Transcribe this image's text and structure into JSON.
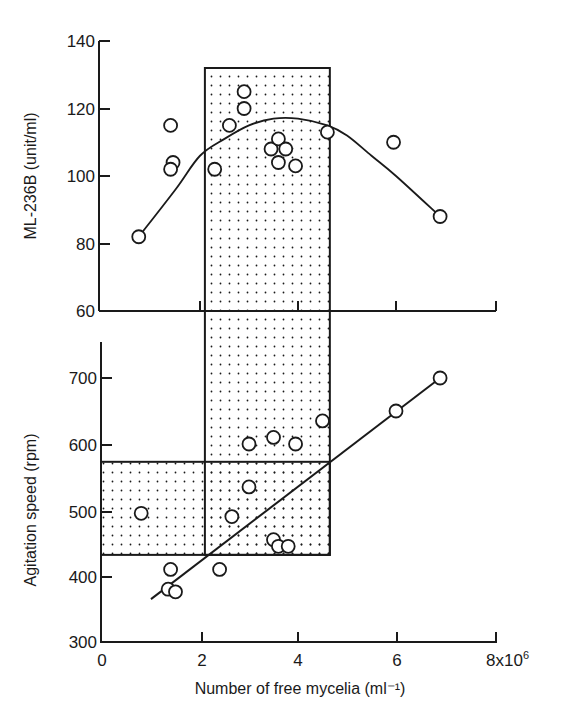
{
  "chart_data": [
    {
      "panel": "top",
      "type": "scatter",
      "title": "",
      "xlabel": "Number of free mycelia (ml⁻¹)",
      "ylabel": "ML-236B (unit/ml)",
      "xlim": [
        0,
        8
      ],
      "ylim": [
        60,
        140
      ],
      "x_ticks": [
        0,
        2,
        4,
        6,
        8
      ],
      "y_ticks": [
        60,
        80,
        100,
        120,
        140
      ],
      "y_tick_labels": [
        "60",
        "80",
        "100",
        "120",
        "140"
      ],
      "grid": false,
      "points": [
        {
          "x": 0.75,
          "y": 82
        },
        {
          "x": 1.4,
          "y": 115
        },
        {
          "x": 1.45,
          "y": 104
        },
        {
          "x": 1.4,
          "y": 102
        },
        {
          "x": 2.3,
          "y": 102
        },
        {
          "x": 2.6,
          "y": 115
        },
        {
          "x": 2.9,
          "y": 125
        },
        {
          "x": 2.9,
          "y": 120
        },
        {
          "x": 3.45,
          "y": 108
        },
        {
          "x": 3.6,
          "y": 111
        },
        {
          "x": 3.75,
          "y": 108
        },
        {
          "x": 3.6,
          "y": 104
        },
        {
          "x": 3.95,
          "y": 103
        },
        {
          "x": 4.6,
          "y": 113
        },
        {
          "x": 5.95,
          "y": 110
        },
        {
          "x": 6.9,
          "y": 88
        }
      ],
      "fit_curve": {
        "type": "quadratic",
        "points": [
          {
            "x": 0.75,
            "y": 82
          },
          {
            "x": 1.5,
            "y": 96
          },
          {
            "x": 2.0,
            "y": 106
          },
          {
            "x": 2.5,
            "y": 111
          },
          {
            "x": 3.0,
            "y": 115
          },
          {
            "x": 3.5,
            "y": 117
          },
          {
            "x": 4.0,
            "y": 117
          },
          {
            "x": 4.6,
            "y": 115
          },
          {
            "x": 5.0,
            "y": 112
          },
          {
            "x": 5.5,
            "y": 106
          },
          {
            "x": 6.0,
            "y": 100
          },
          {
            "x": 6.9,
            "y": 88
          }
        ]
      },
      "shaded_region": {
        "x_min": 2.1,
        "x_max": 4.65,
        "y_min": 60,
        "y_max": 132
      }
    },
    {
      "panel": "bottom",
      "type": "scatter",
      "title": "",
      "xlabel": "Number of free mycelia (ml⁻¹)",
      "ylabel": "Agitation speed (rpm)",
      "xlim": [
        0,
        8
      ],
      "ylim": [
        300,
        700
      ],
      "x_ticks": [
        0,
        2,
        4,
        6,
        8
      ],
      "x_tick_labels": [
        "0",
        "2",
        "4",
        "6",
        "8x10⁶"
      ],
      "y_ticks": [
        300,
        400,
        500,
        600,
        700
      ],
      "y_tick_labels": [
        "300",
        "400",
        "500",
        "600",
        "700"
      ],
      "grid": false,
      "points": [
        {
          "x": 0.8,
          "y": 495
        },
        {
          "x": 1.4,
          "y": 410
        },
        {
          "x": 1.35,
          "y": 380
        },
        {
          "x": 1.5,
          "y": 376
        },
        {
          "x": 2.4,
          "y": 410
        },
        {
          "x": 2.65,
          "y": 490
        },
        {
          "x": 3.0,
          "y": 535
        },
        {
          "x": 3.0,
          "y": 600
        },
        {
          "x": 3.5,
          "y": 610
        },
        {
          "x": 3.95,
          "y": 600
        },
        {
          "x": 4.5,
          "y": 635
        },
        {
          "x": 3.5,
          "y": 455
        },
        {
          "x": 3.6,
          "y": 445
        },
        {
          "x": 3.8,
          "y": 445
        },
        {
          "x": 6.0,
          "y": 650
        },
        {
          "x": 6.9,
          "y": 700
        }
      ],
      "fit_line": {
        "x1": 1.0,
        "y1": 365,
        "x2": 6.9,
        "y2": 700
      },
      "shaded_region_vertical": {
        "x_min": 2.1,
        "x_max": 4.65,
        "y_min": 432,
        "y_max": 700
      },
      "shaded_region_horizontal": {
        "x_min": 0,
        "x_max": 4.65,
        "y_min": 432,
        "y_max": 573
      }
    }
  ],
  "labels": {
    "top_ylabel": "ML-236B (unit/ml)",
    "bottom_ylabel": "Agitation speed (rpm)",
    "xlabel": "Number of free mycelia (ml⁻¹)",
    "x_tick_0": "0",
    "x_tick_2": "2",
    "x_tick_4": "4",
    "x_tick_6": "6",
    "x_tick_8": "8x10",
    "x_tick_8_exp": "6",
    "top_y_140": "140",
    "top_y_120": "120",
    "top_y_100": "100",
    "top_y_80": "80",
    "top_y_60": "60",
    "bot_y_700": "700",
    "bot_y_600": "600",
    "bot_y_500": "500",
    "bot_y_400": "400",
    "bot_y_300": "300"
  },
  "colors": {
    "ink": "#1a1a1a",
    "background": "#ffffff"
  }
}
